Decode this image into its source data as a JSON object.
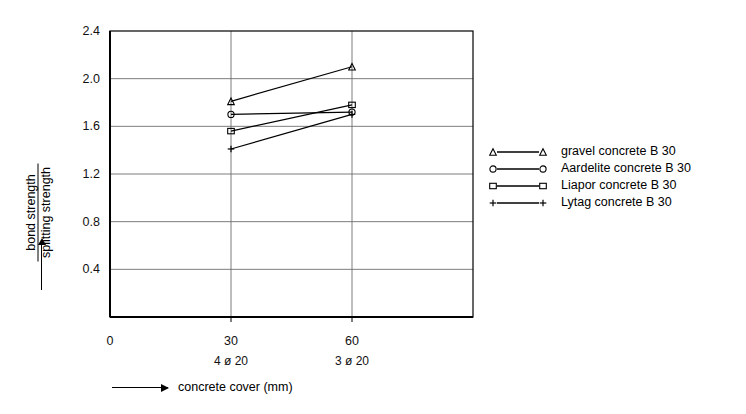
{
  "chart_data": {
    "type": "line",
    "title": "",
    "xlabel": "concrete cover (mm)",
    "ylabel": "bond strength / splitting strength",
    "ylabel_numerator": "bond strength",
    "ylabel_denominator": "splitting strength",
    "x": [
      30,
      60
    ],
    "xlim": [
      0,
      90
    ],
    "ylim": [
      0,
      2.4
    ],
    "xticks": [
      "0",
      "30",
      "60"
    ],
    "xtick_values": [
      0,
      30,
      60
    ],
    "xtick_sublabels": [
      "",
      "4 ø 20",
      "3 ø 20"
    ],
    "yticks": [
      "0.4",
      "0.8",
      "1.2",
      "1.6",
      "2.0",
      "2.4"
    ],
    "ytick_values": [
      0.4,
      0.8,
      1.2,
      1.6,
      2.0,
      2.4
    ],
    "grid": true,
    "grid_axis": "y",
    "legend_position": "right",
    "series": [
      {
        "name": "gravel concrete B 30",
        "marker": "triangle",
        "values": [
          1.81,
          2.1
        ],
        "color": "#000000"
      },
      {
        "name": "Aardelite concrete B 30",
        "marker": "circle",
        "values": [
          1.7,
          1.72
        ],
        "color": "#000000"
      },
      {
        "name": "Liapor concrete B 30",
        "marker": "square",
        "values": [
          1.56,
          1.78
        ],
        "color": "#000000"
      },
      {
        "name": "Lytag concrete B 30",
        "marker": "plus",
        "values": [
          1.41,
          1.7
        ],
        "color": "#000000"
      }
    ]
  },
  "axis": {
    "x_arrow_label": "concrete cover (mm)"
  }
}
